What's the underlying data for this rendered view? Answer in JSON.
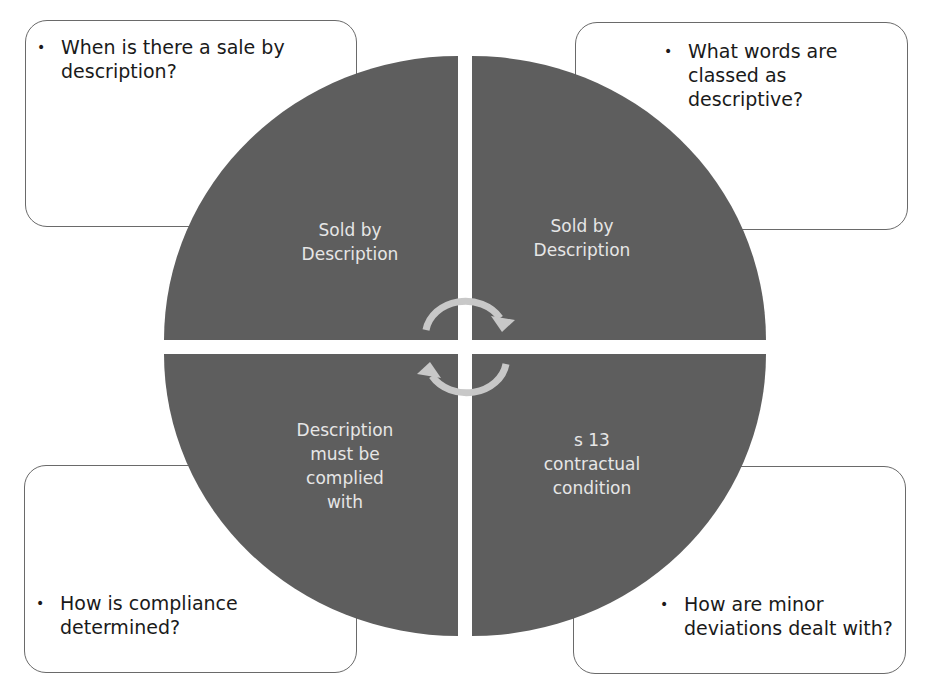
{
  "colors": {
    "quadrant_fill": "#5e5e5e",
    "arrow": "#c8c8c8",
    "label_text": "#e6e6e6",
    "box_border": "#6a6a6a"
  },
  "quadrants": [
    {
      "position": "top-left",
      "label": "Sold by\nDescription",
      "lines": [
        "Sold by",
        "Description"
      ]
    },
    {
      "position": "top-right",
      "label": "Sold by\nDescription",
      "lines": [
        "Sold by",
        "Description"
      ]
    },
    {
      "position": "bottom-left",
      "label": "Description must be complied with",
      "lines": [
        "Description",
        "must be",
        "complied",
        "with"
      ]
    },
    {
      "position": "bottom-right",
      "label": "s 13 contractual condition",
      "lines": [
        "s 13",
        "contractual",
        "condition"
      ]
    }
  ],
  "boxes": {
    "top_left": {
      "bullet": "•",
      "lines": [
        "When is there a sale by",
        "description?"
      ]
    },
    "top_right": {
      "bullet": "•",
      "lines": [
        "What words are",
        "classed as descriptive?"
      ]
    },
    "bottom_left": {
      "bullet": "•",
      "lines": [
        "How is compliance",
        "determined?"
      ]
    },
    "bottom_right": {
      "bullet": "•",
      "lines": [
        "How are minor",
        "deviations dealt with?"
      ]
    }
  },
  "center": {
    "icon": "cycle-arrows-icon"
  }
}
